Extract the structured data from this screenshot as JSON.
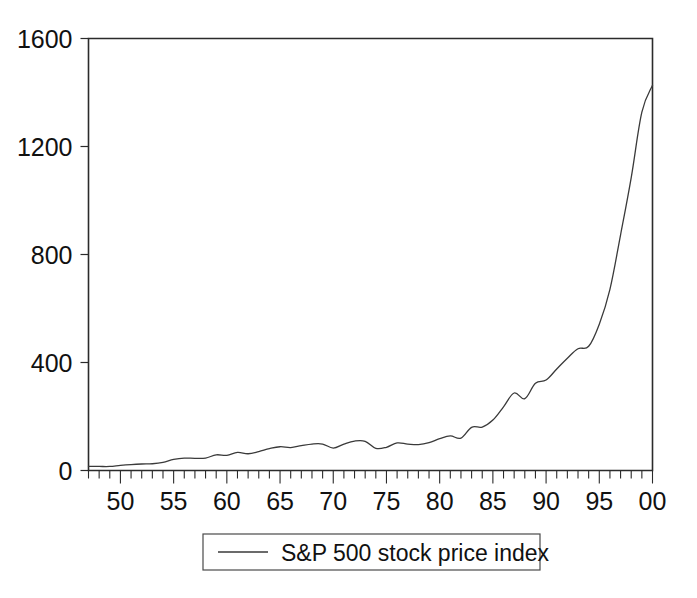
{
  "chart_data": {
    "type": "line",
    "title": "",
    "subtitle": "",
    "xlabel": "",
    "ylabel": "",
    "grid": false,
    "legend_position": "bottom-center",
    "xlim": [
      1947,
      2000
    ],
    "ylim": [
      0,
      1600
    ],
    "y_ticks": [
      0,
      400,
      800,
      1200,
      1600
    ],
    "y_tick_labels": [
      "0",
      "400",
      "800",
      "1200",
      "1600"
    ],
    "x_ticks": [
      1947,
      1948,
      1949,
      1950,
      1951,
      1952,
      1953,
      1954,
      1955,
      1956,
      1957,
      1958,
      1959,
      1960,
      1961,
      1962,
      1963,
      1964,
      1965,
      1966,
      1967,
      1968,
      1969,
      1970,
      1971,
      1972,
      1973,
      1974,
      1975,
      1976,
      1977,
      1978,
      1979,
      1980,
      1981,
      1982,
      1983,
      1984,
      1985,
      1986,
      1987,
      1988,
      1989,
      1990,
      1991,
      1992,
      1993,
      1994,
      1995,
      1996,
      1997,
      1998,
      1999,
      2000
    ],
    "x_labeled_ticks": [
      1950,
      1955,
      1960,
      1965,
      1970,
      1975,
      1980,
      1985,
      1990,
      1995,
      2000
    ],
    "x_tick_labels": [
      "50",
      "55",
      "60",
      "65",
      "70",
      "75",
      "80",
      "85",
      "90",
      "95",
      "00"
    ],
    "series": [
      {
        "name": "S&P 500 stock price index",
        "color": "#3a3a3a",
        "x": [
          1947,
          1948,
          1949,
          1950,
          1951,
          1952,
          1953,
          1954,
          1955,
          1956,
          1957,
          1958,
          1959,
          1960,
          1961,
          1962,
          1963,
          1964,
          1965,
          1966,
          1967,
          1968,
          1969,
          1970,
          1971,
          1972,
          1973,
          1974,
          1975,
          1976,
          1977,
          1978,
          1979,
          1980,
          1981,
          1982,
          1983,
          1984,
          1985,
          1986,
          1987,
          1988,
          1989,
          1990,
          1991,
          1992,
          1993,
          1994,
          1995,
          1996,
          1997,
          1998,
          1999,
          2000
        ],
        "values": [
          15,
          15,
          15,
          19,
          22,
          24,
          25,
          30,
          41,
          46,
          45,
          46,
          58,
          56,
          67,
          62,
          70,
          81,
          88,
          85,
          92,
          98,
          98,
          83,
          98,
          109,
          108,
          82,
          86,
          102,
          98,
          96,
          103,
          118,
          128,
          120,
          160,
          161,
          187,
          236,
          287,
          266,
          323,
          335,
          376,
          416,
          451,
          460,
          542,
          671,
          873,
          1085,
          1327,
          1427
        ]
      }
    ]
  },
  "legend": {
    "entries": [
      {
        "label": "S&P 500 stock price index",
        "marker": "line-swatch"
      }
    ]
  },
  "axes": {
    "y_axis_name": "y-axis",
    "x_axis_name": "x-axis"
  }
}
